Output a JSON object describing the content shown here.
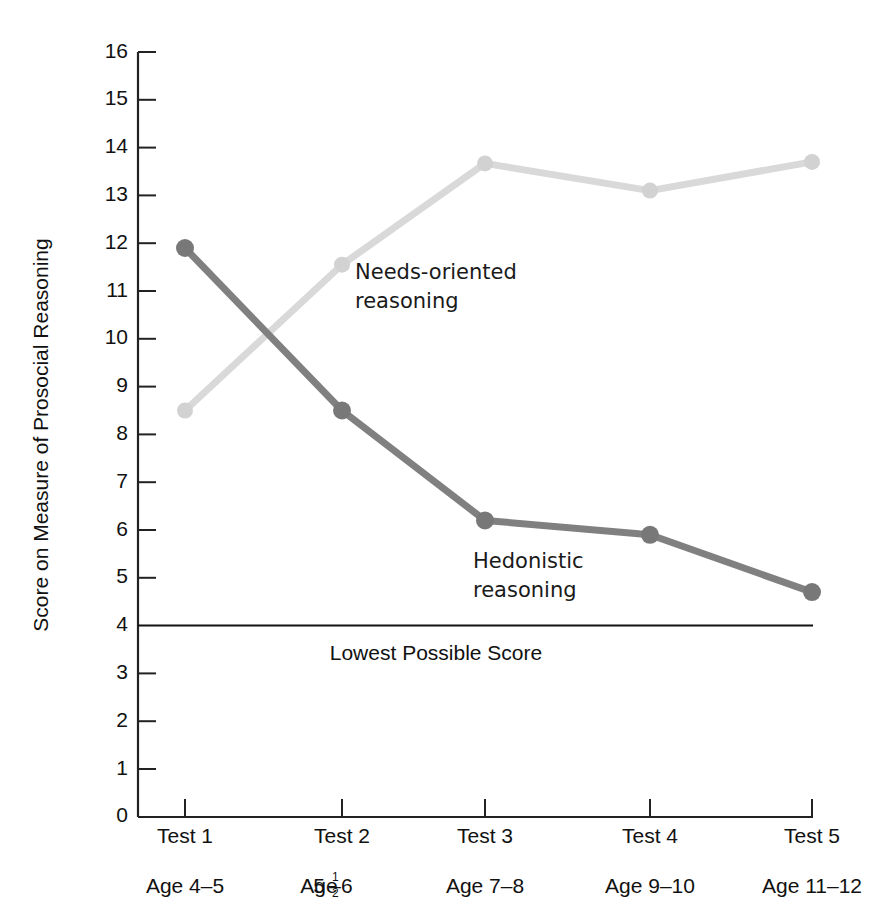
{
  "chart_data": {
    "type": "line",
    "title": "",
    "xlabel": "",
    "ylabel": "Score on Measure of Prosocial Reasoning",
    "ylim": [
      0,
      16
    ],
    "ytick_step": 1,
    "grid": false,
    "legend": "inline-annotations",
    "categories": [
      "Test 1",
      "Test 2",
      "Test 3",
      "Test 4",
      "Test 5"
    ],
    "category_sublabels": [
      "Age 4–5",
      "Age 5½–6",
      "Age 7–8",
      "Age 9–10",
      "Age 11–12"
    ],
    "yticks": [
      "0",
      "1",
      "2",
      "3",
      "4",
      "5",
      "6",
      "7",
      "8",
      "9",
      "10",
      "11",
      "12",
      "13",
      "14",
      "15",
      "16"
    ],
    "series": [
      {
        "name": "Hedonistic reasoning",
        "color": "#808080",
        "values": [
          11.9,
          8.5,
          6.2,
          5.9,
          4.7
        ]
      },
      {
        "name": "Needs-oriented reasoning",
        "color": "#d9d9d9",
        "values": [
          8.5,
          11.55,
          13.67,
          13.1,
          13.7
        ]
      }
    ],
    "annotations": [
      {
        "text_line1": "Needs-oriented",
        "text_line2": "reasoning",
        "x": 355,
        "y": 272
      },
      {
        "text_line1": "Hedonistic",
        "text_line2": "reasoning",
        "x": 473,
        "y": 561
      },
      {
        "text_line1": "Lowest Possible Score",
        "text_line2": "",
        "x": 436,
        "y": 653
      }
    ],
    "reference_line": {
      "label": "Lowest Possible Score",
      "value": 4,
      "color": "#111111"
    }
  },
  "axis": {
    "y_title": "Score on Measure of Prosocial Reasoning",
    "tick_2_fraction": {
      "whole": "5",
      "numerator": "1",
      "denominator": "2",
      "suffix": "–6",
      "prefix": "Age "
    }
  }
}
